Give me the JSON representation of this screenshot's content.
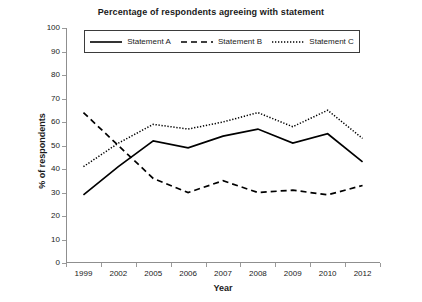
{
  "chart_data": {
    "type": "line",
    "title": "Percentage of respondents agreeing with statement",
    "xlabel": "Year",
    "ylabel": "% of respondents",
    "categories": [
      "1999",
      "2002",
      "2005",
      "2006",
      "2007",
      "2008",
      "2009",
      "2010",
      "2012"
    ],
    "ylim": [
      0,
      100
    ],
    "ytick_step": 10,
    "yticks": [
      "100",
      "90",
      "80",
      "70",
      "60",
      "50",
      "40",
      "30",
      "20",
      "10",
      "0"
    ],
    "grid": false,
    "legend_position": "top-inside",
    "series": [
      {
        "name": "Statement A",
        "style": "solid",
        "color": "#000000",
        "values": [
          29,
          41,
          52,
          49,
          54,
          57,
          51,
          55,
          43
        ]
      },
      {
        "name": "Statement B",
        "style": "dashed",
        "color": "#000000",
        "values": [
          64,
          50,
          36,
          30,
          35,
          30,
          31,
          29,
          33
        ]
      },
      {
        "name": "Statement C",
        "style": "dotted",
        "color": "#000000",
        "values": [
          41,
          51,
          59,
          57,
          60,
          64,
          58,
          65,
          53
        ]
      }
    ]
  }
}
